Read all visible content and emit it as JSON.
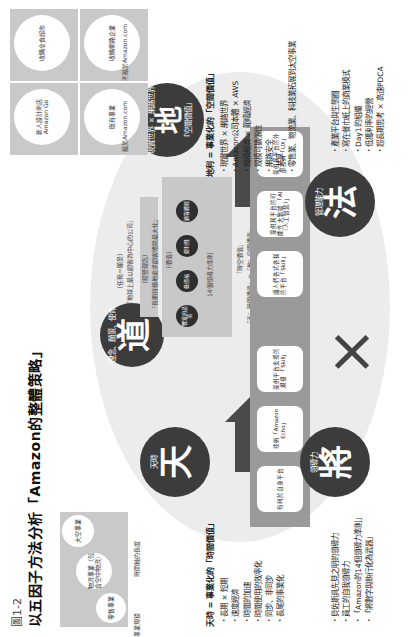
{
  "figure": {
    "label": "圖1-2",
    "title": "以五因子方法分析「Amazon的整體策略」"
  },
  "factors": {
    "tian": {
      "char": "天",
      "label": "天時"
    },
    "di": {
      "char": "地",
      "label": "地利",
      "sub": "現實世界 × 網路世界",
      "note": "「空間價值」"
    },
    "dao": {
      "char": "道",
      "label": "理念、願景、使命"
    },
    "jiang": {
      "char": "將",
      "label": "領導力"
    },
    "fa": {
      "char": "法",
      "label": "管理能力"
    }
  },
  "time_chart": {
    "xlabel": "時間軸的長度",
    "ylabel": "事業規模",
    "circles": [
      "大空事業",
      "物流事業（包含空中物流）",
      "零售事業"
    ]
  },
  "space_chart": {
    "circles": [
      "新人設計商店 Amazon Go",
      "收購全食超市",
      "既有事業",
      "收購網路企業"
    ],
    "label_left": "屬於Amazon.com",
    "label_right": "不屬於Amazon.com",
    "axis_left": "數位世界",
    "axis_right": "現實世界"
  },
  "di_list": {
    "heading": "地利 = 事業化的「空間價值」",
    "items": [
      "現實世界 × 網路世界",
      "Amazon公司本體 × AWS",
      "規模經濟 × 範疇經濟",
      "規模可擴張性",
      "網路安全",
      "共享",
      "零售業、物流業、科技業拓展到太空事業"
    ]
  },
  "tian_list": {
    "heading": "天時 = 事業化的「時間價值」",
    "items": [
      "長期 × 短期",
      "速度經濟",
      "時間的加速",
      "時間使用的效率化",
      "同步、非同步",
      "長尾的事業化"
    ]
  },
  "fa_list": {
    "items": [
      "產業平台與生態圈",
      "寫在餐巾紙上的商業模式",
      "Day1的組織",
      "低獲利率的經營",
      "超長期思考 × 高速PDCA"
    ]
  },
  "jiang_list": {
    "items": [
      "貝佐斯具先見之明的領導力",
      "員工的自我領導力",
      "「Amazon的14個領導力準則」",
      "「將數字與執行化為武器」"
    ]
  },
  "dao_pyramid": {
    "top": "〔任務＝願景〕",
    "top_text": "「地球上最以顧客為中心的公司」",
    "mid": "〔經營理念〕",
    "mid_text": "「長期持續地追求顧客體驗最大化」",
    "base": "〔價值〕",
    "base_text": "14個領導力準則",
    "nodes": [
      "豐富的品項",
      "低價格",
      "便利性",
      "顧客體驗"
    ],
    "quote1": "「時空價值」",
    "quote2": "「天：時間價值」×「地：空間價值」",
    "quote3": "「時空價值的5個主軸」"
  },
  "fa_band": {
    "items": [
      "讓人們各式各樣的平台「Skill」",
      "提供其平台的可能性 大數據 「AI（人工智慧）」",
      "提供其平台的外部技術「UX」"
    ]
  },
  "jiang_band": {
    "items": [
      "有利於自身平台",
      "技術「Amazon Echo」",
      "提供平台支援的 規模 「Skill」"
    ]
  },
  "cross_symbol": "×"
}
